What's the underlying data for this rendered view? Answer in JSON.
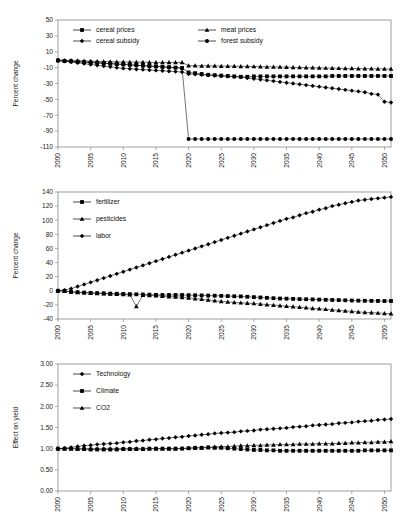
{
  "figure": {
    "title": "",
    "panel_count": 3
  },
  "chart_data": [
    {
      "type": "line",
      "title": "",
      "xlabel": "",
      "ylabel": "Percent change",
      "xlim": [
        2000,
        2051
      ],
      "ylim": [
        -110,
        50
      ],
      "ytick_labels": [
        "50",
        "30",
        "10",
        "-10",
        "-30",
        "-50",
        "-70",
        "-90",
        "-110"
      ],
      "yticks": [
        50,
        30,
        10,
        -10,
        -30,
        -50,
        -70,
        -90,
        -110
      ],
      "xtick_labels": [
        "2000",
        "2005",
        "2010",
        "2015",
        "2020",
        "2025",
        "2030",
        "2035",
        "2040",
        "2045",
        "2050"
      ],
      "xticks": [
        2000,
        2005,
        2010,
        2015,
        2020,
        2025,
        2030,
        2035,
        2040,
        2045,
        2050
      ],
      "grid": false,
      "legend_position": "top-inside",
      "x": [
        2000,
        2001,
        2002,
        2003,
        2004,
        2005,
        2006,
        2007,
        2008,
        2009,
        2010,
        2011,
        2012,
        2013,
        2014,
        2015,
        2016,
        2017,
        2018,
        2019,
        2020,
        2021,
        2022,
        2023,
        2024,
        2025,
        2026,
        2027,
        2028,
        2029,
        2030,
        2031,
        2032,
        2033,
        2034,
        2035,
        2036,
        2037,
        2038,
        2039,
        2040,
        2041,
        2042,
        2043,
        2044,
        2045,
        2046,
        2047,
        2048,
        2049,
        2050,
        2051
      ],
      "series": [
        {
          "name": "cereal prices",
          "marker": "square",
          "values": [
            -1,
            -1.5,
            -2,
            -2.5,
            -3,
            -3.5,
            -4,
            -4.5,
            -5,
            -5.5,
            -6,
            -6.5,
            -7,
            -7.5,
            -8,
            -8.5,
            -9,
            -9.5,
            -10,
            -10.5,
            -16,
            -17,
            -18,
            -19,
            -19.5,
            -20,
            -20.5,
            -21,
            -21.5,
            -21.5,
            -21,
            -21,
            -21,
            -21,
            -21,
            -21,
            -21,
            -21,
            -21,
            -21,
            -21,
            -21,
            -20.5,
            -20.5,
            -20.5,
            -20.5,
            -20.5,
            -20.5,
            -20.5,
            -20.5,
            -20.5,
            -20.5
          ]
        },
        {
          "name": "meat prices",
          "marker": "triangle",
          "values": [
            -0.5,
            -0.8,
            -1,
            -1.3,
            -1.6,
            -1.9,
            -2.1,
            -2.3,
            -2.5,
            -2.7,
            -2.9,
            -3,
            -3.1,
            -3.2,
            -3.3,
            -3.4,
            -3.4,
            -3.5,
            -3.5,
            -3.5,
            -7.5,
            -7.6,
            -7.7,
            -7.8,
            -7.9,
            -8,
            -8.1,
            -8.2,
            -8.3,
            -8.4,
            -8.6,
            -8.8,
            -9,
            -9.1,
            -9.2,
            -9.4,
            -9.6,
            -9.8,
            -10,
            -10.1,
            -10.3,
            -10.5,
            -10.6,
            -10.8,
            -11,
            -11.1,
            -11.2,
            -11.3,
            -11.4,
            -11.5,
            -11.6,
            -11.7
          ]
        },
        {
          "name": "cereal subsidy",
          "marker": "diamond",
          "values": [
            -1,
            -2,
            -3,
            -4,
            -5,
            -6,
            -7,
            -8,
            -9,
            -10,
            -11,
            -11.5,
            -12,
            -12.5,
            -13,
            -13.5,
            -14,
            -14.5,
            -15,
            -15.5,
            -18,
            -18.5,
            -19,
            -19.5,
            -20,
            -20.5,
            -21,
            -21.5,
            -22,
            -23,
            -24,
            -25,
            -26,
            -27,
            -28,
            -29,
            -30,
            -31,
            -32,
            -33,
            -34,
            -35,
            -36,
            -37,
            -38,
            -39,
            -40,
            -41,
            -43,
            -44,
            -53,
            -54
          ]
        },
        {
          "name": "forest subsidy",
          "marker": "circle",
          "values": [
            -1,
            -1.5,
            -2,
            -2.5,
            -3,
            -3.5,
            -4,
            -4.5,
            -5,
            -5.5,
            -6,
            -6.5,
            -7,
            -7.5,
            -8,
            -8.5,
            -9,
            -9.5,
            -10,
            -10.5,
            -100,
            -100,
            -100,
            -100,
            -100,
            -100,
            -100,
            -100,
            -100,
            -100,
            -100,
            -100,
            -100,
            -100,
            -100,
            -100,
            -100,
            -100,
            -100,
            -100,
            -100,
            -100,
            -100,
            -100,
            -100,
            -100,
            -100,
            -100,
            -100,
            -100,
            -100,
            -100
          ]
        }
      ]
    },
    {
      "type": "line",
      "title": "",
      "xlabel": "",
      "ylabel": "Percent change",
      "xlim": [
        2000,
        2051
      ],
      "ylim": [
        -40,
        140
      ],
      "ytick_labels": [
        "140",
        "120",
        "100",
        "80",
        "60",
        "40",
        "20",
        "0",
        "-20",
        "-40"
      ],
      "yticks": [
        140,
        120,
        100,
        80,
        60,
        40,
        20,
        0,
        -20,
        -40
      ],
      "xtick_labels": [
        "2000",
        "2005",
        "2010",
        "2015",
        "2020",
        "2025",
        "2030",
        "2035",
        "2040",
        "2045",
        "2050"
      ],
      "xticks": [
        2000,
        2005,
        2010,
        2015,
        2020,
        2025,
        2030,
        2035,
        2040,
        2045,
        2050
      ],
      "grid": false,
      "legend_position": "upper-left-inside",
      "x": [
        2000,
        2001,
        2002,
        2003,
        2004,
        2005,
        2006,
        2007,
        2008,
        2009,
        2010,
        2011,
        2012,
        2013,
        2014,
        2015,
        2016,
        2017,
        2018,
        2019,
        2020,
        2021,
        2022,
        2023,
        2024,
        2025,
        2026,
        2027,
        2028,
        2029,
        2030,
        2031,
        2032,
        2033,
        2034,
        2035,
        2036,
        2037,
        2038,
        2039,
        2040,
        2041,
        2042,
        2043,
        2044,
        2045,
        2046,
        2047,
        2048,
        2049,
        2050,
        2051
      ],
      "series": [
        {
          "name": "fertilizer",
          "marker": "square",
          "values": [
            0,
            -0.5,
            -1.5,
            -2,
            -2.5,
            -3,
            -3.3,
            -3.6,
            -4,
            -4.2,
            -4.5,
            -4.8,
            -5,
            -5.2,
            -5.5,
            -5.8,
            -6,
            -6,
            -6,
            -6,
            -6.2,
            -6.4,
            -6.6,
            -6.8,
            -7,
            -7.2,
            -7.5,
            -7.8,
            -8,
            -8.5,
            -9,
            -9.5,
            -10,
            -10.5,
            -11,
            -11.2,
            -11.5,
            -11.8,
            -12,
            -12.2,
            -12.5,
            -12.8,
            -13,
            -13.2,
            -13.5,
            -13.8,
            -14,
            -14.2,
            -14.3,
            -14.4,
            -14.5,
            -14.5
          ]
        },
        {
          "name": "pesticides",
          "marker": "triangle",
          "values": [
            0,
            -0.5,
            -1.5,
            -2.2,
            -2.8,
            -3.2,
            -3.6,
            -4,
            -4.4,
            -4.8,
            -5.2,
            -5.6,
            -22,
            -6.2,
            -6.6,
            -7,
            -7.6,
            -8.2,
            -8.8,
            -9.4,
            -10,
            -11,
            -12,
            -13,
            -14,
            -15,
            -15.8,
            -16.5,
            -17,
            -17.5,
            -18,
            -18.8,
            -19.5,
            -20.2,
            -21,
            -21.8,
            -22.5,
            -23.2,
            -24,
            -24.8,
            -25.5,
            -26.2,
            -27,
            -27.8,
            -28.5,
            -29.2,
            -30,
            -30.5,
            -31,
            -31.5,
            -32,
            -32.5
          ]
        },
        {
          "name": "labor",
          "marker": "diamond",
          "values": [
            0,
            1,
            3,
            6,
            9,
            12,
            15,
            18,
            21,
            24,
            27,
            30,
            33,
            36,
            39,
            42,
            45,
            48,
            51,
            54,
            57,
            60,
            63,
            66,
            69,
            72,
            75,
            78,
            81,
            84,
            87,
            90,
            93,
            96,
            99,
            102,
            104,
            107,
            110,
            112,
            115,
            117,
            120,
            122,
            124,
            126,
            128,
            129,
            130,
            131,
            132,
            133
          ]
        }
      ]
    },
    {
      "type": "line",
      "title": "",
      "xlabel": "",
      "ylabel": "Effect on yield",
      "xlim": [
        2000,
        2051
      ],
      "ylim": [
        0.0,
        3.0
      ],
      "ytick_labels": [
        "3.00",
        "2.50",
        "2.00",
        "1.50",
        "1.00",
        "0.50",
        "0.00"
      ],
      "yticks": [
        3.0,
        2.5,
        2.0,
        1.5,
        1.0,
        0.5,
        0.0
      ],
      "xtick_labels": [
        "2000",
        "2005",
        "2010",
        "2015",
        "2020",
        "2025",
        "2030",
        "2035",
        "2040",
        "2045",
        "2050"
      ],
      "xticks": [
        2000,
        2005,
        2010,
        2015,
        2020,
        2025,
        2030,
        2035,
        2040,
        2045,
        2050
      ],
      "grid": false,
      "legend_position": "upper-left-inside",
      "x": [
        2000,
        2001,
        2002,
        2003,
        2004,
        2005,
        2006,
        2007,
        2008,
        2009,
        2010,
        2011,
        2012,
        2013,
        2014,
        2015,
        2016,
        2017,
        2018,
        2019,
        2020,
        2021,
        2022,
        2023,
        2024,
        2025,
        2026,
        2027,
        2028,
        2029,
        2030,
        2031,
        2032,
        2033,
        2034,
        2035,
        2036,
        2037,
        2038,
        2039,
        2040,
        2041,
        2042,
        2043,
        2044,
        2045,
        2046,
        2047,
        2048,
        2049,
        2050,
        2051
      ],
      "series": [
        {
          "name": "Technology",
          "marker": "diamond",
          "values": [
            1.0,
            1.01,
            1.03,
            1.05,
            1.07,
            1.08,
            1.1,
            1.11,
            1.12,
            1.13,
            1.15,
            1.16,
            1.18,
            1.19,
            1.21,
            1.22,
            1.24,
            1.25,
            1.27,
            1.28,
            1.3,
            1.31,
            1.33,
            1.34,
            1.36,
            1.37,
            1.38,
            1.39,
            1.41,
            1.42,
            1.43,
            1.45,
            1.46,
            1.47,
            1.48,
            1.49,
            1.51,
            1.52,
            1.53,
            1.55,
            1.56,
            1.57,
            1.58,
            1.6,
            1.61,
            1.62,
            1.64,
            1.65,
            1.66,
            1.68,
            1.69,
            1.7
          ]
        },
        {
          "name": "Climate",
          "marker": "square",
          "values": [
            1.0,
            1.0,
            1.0,
            0.99,
            0.99,
            0.98,
            0.98,
            0.98,
            0.98,
            0.98,
            0.99,
            0.99,
            0.99,
            0.99,
            1.0,
            1.0,
            1.0,
            1.0,
            1.0,
            1.0,
            1.01,
            1.02,
            1.02,
            1.03,
            1.02,
            1.02,
            1.01,
            1.0,
            0.99,
            0.98,
            0.97,
            0.97,
            0.96,
            0.96,
            0.95,
            0.95,
            0.95,
            0.95,
            0.95,
            0.95,
            0.95,
            0.95,
            0.95,
            0.95,
            0.95,
            0.95,
            0.95,
            0.96,
            0.96,
            0.96,
            0.96,
            0.96
          ]
        },
        {
          "name": "CO2",
          "marker": "triangle",
          "values": [
            1.0,
            1.0,
            1.0,
            1.0,
            1.0,
            1.0,
            1.0,
            1.0,
            1.0,
            1.0,
            1.0,
            1.0,
            1.0,
            1.0,
            1.0,
            1.0,
            1.0,
            1.0,
            1.0,
            1.01,
            1.01,
            1.02,
            1.02,
            1.03,
            1.04,
            1.05,
            1.05,
            1.06,
            1.07,
            1.07,
            1.08,
            1.08,
            1.09,
            1.09,
            1.1,
            1.1,
            1.1,
            1.11,
            1.11,
            1.11,
            1.12,
            1.12,
            1.12,
            1.13,
            1.13,
            1.14,
            1.14,
            1.15,
            1.15,
            1.16,
            1.16,
            1.17
          ]
        }
      ]
    }
  ],
  "caption": {
    "text": ""
  }
}
